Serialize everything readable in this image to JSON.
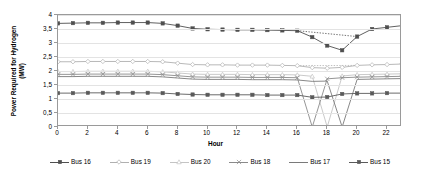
{
  "chart_data": {
    "type": "line",
    "title": "",
    "xlabel": "Hour",
    "ylabel": "Power Required for Hydrogen\n(MW)",
    "xlim": [
      0,
      23
    ],
    "ylim": [
      0,
      4
    ],
    "grid": true,
    "legend_position": "bottom",
    "x": [
      0,
      1,
      2,
      3,
      4,
      5,
      6,
      7,
      8,
      9,
      10,
      11,
      12,
      13,
      14,
      15,
      16,
      17,
      18,
      19,
      20,
      21,
      22,
      23
    ],
    "xticks": [
      "0",
      "2",
      "4",
      "6",
      "8",
      "10",
      "12",
      "14",
      "16",
      "18",
      "20",
      "22"
    ],
    "xtick_values": [
      0,
      2,
      4,
      6,
      8,
      10,
      12,
      14,
      16,
      18,
      20,
      22
    ],
    "yticks": [
      "0",
      "0,5",
      "1",
      "1,5",
      "2",
      "2,5",
      "3",
      "3,5",
      "4"
    ],
    "ytick_values": [
      0,
      0.5,
      1,
      1.5,
      2,
      2.5,
      3,
      3.5,
      4
    ],
    "series": [
      {
        "name": "Bus 16",
        "color": "#4f4f4f",
        "marker": "square",
        "values": [
          3.7,
          3.71,
          3.72,
          3.72,
          3.73,
          3.73,
          3.73,
          3.7,
          3.62,
          3.52,
          3.49,
          3.48,
          3.47,
          3.47,
          3.46,
          3.45,
          3.44,
          3.21,
          2.91,
          2.74,
          3.23,
          3.5,
          3.56,
          3.62
        ]
      },
      {
        "name": "Bus 19",
        "color": "#b0b0b0",
        "marker": "diamond",
        "values": [
          2.33,
          2.33,
          2.34,
          2.34,
          2.34,
          2.34,
          2.34,
          2.33,
          2.28,
          2.23,
          2.22,
          2.22,
          2.21,
          2.21,
          2.21,
          2.2,
          2.19,
          2.12,
          2.1,
          2.13,
          2.2,
          2.22,
          2.23,
          2.25
        ]
      },
      {
        "name": "Bus 20",
        "color": "#c4c4c4",
        "marker": "triangle",
        "values": [
          1.98,
          1.98,
          1.99,
          1.99,
          1.99,
          1.99,
          1.99,
          1.97,
          1.93,
          1.89,
          1.88,
          1.88,
          1.88,
          1.87,
          1.87,
          1.87,
          1.86,
          1.81,
          0.0,
          1.82,
          1.87,
          1.88,
          1.89,
          1.9
        ]
      },
      {
        "name": "Bus 18",
        "color": "#8a8a8a",
        "marker": "cross",
        "values": [
          1.88,
          1.88,
          1.89,
          1.89,
          1.89,
          1.89,
          1.89,
          1.87,
          1.83,
          1.79,
          1.78,
          1.78,
          1.78,
          1.77,
          1.77,
          1.77,
          1.76,
          0.0,
          1.72,
          1.76,
          1.78,
          1.79,
          1.8,
          1.81
        ]
      },
      {
        "name": "Bus 17",
        "color": "#7a7a7a",
        "marker": "none",
        "values": [
          1.8,
          1.8,
          1.81,
          1.81,
          1.81,
          1.81,
          1.81,
          1.79,
          1.75,
          1.71,
          1.7,
          1.7,
          1.7,
          1.69,
          1.69,
          1.69,
          1.68,
          1.63,
          1.64,
          0.0,
          1.7,
          1.71,
          1.72,
          1.73
        ]
      },
      {
        "name": "Bus 15",
        "color": "#5a5a5a",
        "marker": "square",
        "values": [
          1.21,
          1.21,
          1.22,
          1.22,
          1.22,
          1.22,
          1.22,
          1.21,
          1.18,
          1.16,
          1.15,
          1.15,
          1.15,
          1.15,
          1.14,
          1.14,
          1.14,
          1.06,
          1.07,
          1.18,
          1.2,
          1.2,
          1.21,
          1.21
        ]
      }
    ],
    "annotations": [
      {
        "type": "dotted-reference",
        "series": "Bus 16",
        "from_x": 16,
        "to_x": 20,
        "note": "dotted line bridging dip"
      },
      {
        "type": "dotted-reference",
        "series": "Bus 19",
        "from_x": 16,
        "to_x": 20,
        "note": "dotted line bridging dip"
      }
    ]
  },
  "legend": {
    "items": [
      {
        "label": "Bus 16"
      },
      {
        "label": "Bus 19"
      },
      {
        "label": "Bus 20"
      },
      {
        "label": "Bus 18"
      },
      {
        "label": "Bus 17"
      },
      {
        "label": "Bus 15"
      }
    ]
  }
}
